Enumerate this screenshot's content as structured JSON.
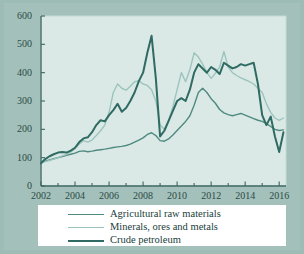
{
  "figure": {
    "background_color": "#9dbcb5",
    "plot_background_color": "#dbe9e6",
    "axis_color": "#3d6660",
    "legend_background": "#ffffff"
  },
  "legend": {
    "position": "below-axis",
    "entries": [
      {
        "label": "Agricultural raw materials",
        "color": "#4e8a80",
        "width": 1.4
      },
      {
        "label": "Minerals, ores and metals",
        "color": "#9cc4bd",
        "width": 1.4
      },
      {
        "label": "Crude petroleum",
        "color": "#2f6a63",
        "width": 2.0
      }
    ]
  },
  "chart_data": {
    "type": "line",
    "title": "",
    "xlabel": "",
    "ylabel": "",
    "xlim": [
      2002,
      2016.4
    ],
    "ylim": [
      0,
      600
    ],
    "ytick_step": 100,
    "yticks": [
      0,
      100,
      200,
      300,
      400,
      500,
      600
    ],
    "xticks": [
      2002,
      2004,
      2006,
      2008,
      2010,
      2012,
      2014,
      2016
    ],
    "xtick_minor_step": 1,
    "grid": false,
    "series": [
      {
        "name": "Agricultural raw materials",
        "color": "#4e8a80",
        "x": [
          2002.0,
          2002.25,
          2002.5,
          2002.75,
          2003.0,
          2003.25,
          2003.5,
          2003.75,
          2004.0,
          2004.25,
          2004.5,
          2004.75,
          2005.0,
          2005.25,
          2005.5,
          2005.75,
          2006.0,
          2006.25,
          2006.5,
          2006.75,
          2007.0,
          2007.25,
          2007.5,
          2007.75,
          2008.0,
          2008.25,
          2008.5,
          2008.75,
          2009.0,
          2009.25,
          2009.5,
          2009.75,
          2010.0,
          2010.25,
          2010.5,
          2010.75,
          2011.0,
          2011.25,
          2011.5,
          2011.75,
          2012.0,
          2012.25,
          2012.5,
          2012.75,
          2013.0,
          2013.25,
          2013.5,
          2013.75,
          2014.0,
          2014.25,
          2014.5,
          2014.75,
          2015.0,
          2015.25,
          2015.5,
          2015.75,
          2016.0,
          2016.25
        ],
        "values": [
          85,
          88,
          92,
          96,
          100,
          104,
          108,
          112,
          116,
          122,
          124,
          121,
          123,
          126,
          128,
          130,
          133,
          136,
          138,
          140,
          143,
          148,
          155,
          162,
          170,
          182,
          188,
          178,
          160,
          158,
          166,
          180,
          196,
          212,
          228,
          248,
          285,
          330,
          345,
          330,
          308,
          292,
          270,
          258,
          252,
          248,
          252,
          256,
          250,
          244,
          238,
          232,
          228,
          220,
          210,
          200,
          196,
          198
        ]
      },
      {
        "name": "Minerals, ores and metals",
        "color": "#9cc4bd",
        "x": [
          2002.0,
          2002.25,
          2002.5,
          2002.75,
          2003.0,
          2003.25,
          2003.5,
          2003.75,
          2004.0,
          2004.25,
          2004.5,
          2004.75,
          2005.0,
          2005.25,
          2005.5,
          2005.75,
          2006.0,
          2006.25,
          2006.5,
          2006.75,
          2007.0,
          2007.25,
          2007.5,
          2007.75,
          2008.0,
          2008.25,
          2008.5,
          2008.75,
          2009.0,
          2009.25,
          2009.5,
          2009.75,
          2010.0,
          2010.25,
          2010.5,
          2010.75,
          2011.0,
          2011.25,
          2011.5,
          2011.75,
          2012.0,
          2012.25,
          2012.5,
          2012.75,
          2013.0,
          2013.25,
          2013.5,
          2013.75,
          2014.0,
          2014.25,
          2014.5,
          2014.75,
          2015.0,
          2015.25,
          2015.5,
          2015.75,
          2016.0,
          2016.25
        ],
        "values": [
          82,
          86,
          90,
          95,
          100,
          106,
          112,
          120,
          132,
          148,
          160,
          155,
          162,
          178,
          195,
          215,
          260,
          330,
          360,
          345,
          338,
          352,
          368,
          372,
          360,
          355,
          340,
          300,
          215,
          200,
          230,
          280,
          340,
          400,
          368,
          410,
          470,
          455,
          430,
          400,
          380,
          398,
          420,
          475,
          420,
          400,
          390,
          382,
          375,
          368,
          360,
          345,
          330,
          290,
          260,
          240,
          232,
          240
        ]
      },
      {
        "name": "Crude petroleum",
        "color": "#2f6a63",
        "x": [
          2002.0,
          2002.25,
          2002.5,
          2002.75,
          2003.0,
          2003.25,
          2003.5,
          2003.75,
          2004.0,
          2004.25,
          2004.5,
          2004.75,
          2005.0,
          2005.25,
          2005.5,
          2005.75,
          2006.0,
          2006.25,
          2006.5,
          2006.75,
          2007.0,
          2007.25,
          2007.5,
          2007.75,
          2008.0,
          2008.25,
          2008.5,
          2008.75,
          2009.0,
          2009.25,
          2009.5,
          2009.75,
          2010.0,
          2010.25,
          2010.5,
          2010.75,
          2011.0,
          2011.25,
          2011.5,
          2011.75,
          2012.0,
          2012.25,
          2012.5,
          2012.75,
          2013.0,
          2013.25,
          2013.5,
          2013.75,
          2014.0,
          2014.25,
          2014.5,
          2014.75,
          2015.0,
          2015.25,
          2015.5,
          2015.75,
          2016.0,
          2016.25
        ],
        "values": [
          80,
          95,
          105,
          112,
          118,
          120,
          118,
          125,
          135,
          155,
          168,
          172,
          190,
          215,
          232,
          228,
          250,
          268,
          290,
          262,
          275,
          300,
          330,
          370,
          400,
          470,
          530,
          380,
          175,
          195,
          230,
          265,
          300,
          310,
          300,
          340,
          400,
          430,
          415,
          400,
          420,
          410,
          395,
          435,
          425,
          415,
          420,
          430,
          425,
          430,
          435,
          360,
          250,
          215,
          245,
          175,
          120,
          190
        ]
      }
    ]
  }
}
